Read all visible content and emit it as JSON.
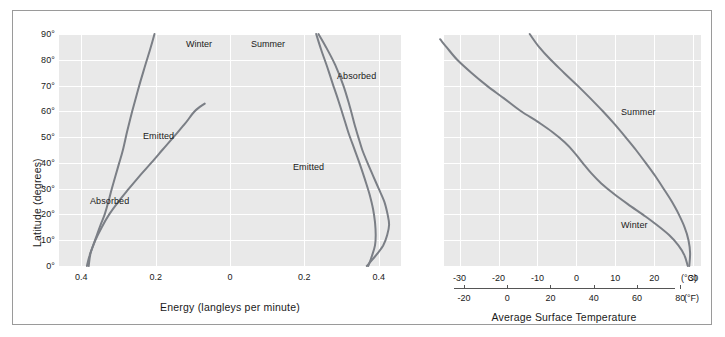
{
  "chart_data": {
    "type": "line",
    "title": "",
    "ylabel": "Latitude (degrees)",
    "ylim": [
      0,
      90
    ],
    "y_ticks": [
      "0°",
      "10°",
      "20°",
      "30°",
      "40°",
      "50°",
      "60°",
      "70°",
      "80°",
      "90°"
    ],
    "y_tick_values": [
      0,
      10,
      20,
      30,
      40,
      50,
      60,
      70,
      80,
      90
    ],
    "grid": true,
    "legend_position": "inline-annotations",
    "panels": [
      {
        "name": "energy-panel",
        "xlabel": "Energy (langleys per minute)",
        "season_headers": [
          "Winter",
          "Summer"
        ],
        "subpanels": [
          {
            "season": "Winter",
            "x_ticks": [
              "0.2",
              "0.4"
            ],
            "x_tick_values": [
              0.2,
              0.4
            ],
            "xlim": [
              0.0,
              0.46
            ],
            "series": [
              {
                "name": "Absorbed",
                "points": [
                  [
                    0.38,
                    0
                  ],
                  [
                    0.375,
                    5
                  ],
                  [
                    0.362,
                    10
                  ],
                  [
                    0.345,
                    15
                  ],
                  [
                    0.325,
                    20
                  ],
                  [
                    0.3,
                    25
                  ],
                  [
                    0.272,
                    30
                  ],
                  [
                    0.243,
                    35
                  ],
                  [
                    0.212,
                    40
                  ],
                  [
                    0.182,
                    45
                  ],
                  [
                    0.152,
                    50
                  ],
                  [
                    0.122,
                    55
                  ],
                  [
                    0.095,
                    60
                  ],
                  [
                    0.068,
                    63
                  ]
                ]
              },
              {
                "name": "Emitted",
                "points": [
                  [
                    0.385,
                    0
                  ],
                  [
                    0.378,
                    4
                  ],
                  [
                    0.368,
                    8
                  ],
                  [
                    0.358,
                    12
                  ],
                  [
                    0.348,
                    16
                  ],
                  [
                    0.337,
                    20
                  ],
                  [
                    0.327,
                    25
                  ],
                  [
                    0.318,
                    30
                  ],
                  [
                    0.308,
                    35
                  ],
                  [
                    0.298,
                    40
                  ],
                  [
                    0.288,
                    45
                  ],
                  [
                    0.277,
                    52
                  ],
                  [
                    0.263,
                    60
                  ],
                  [
                    0.248,
                    68
                  ],
                  [
                    0.232,
                    76
                  ],
                  [
                    0.215,
                    84
                  ],
                  [
                    0.203,
                    90
                  ]
                ]
              }
            ]
          },
          {
            "season": "Summer",
            "x_ticks": [
              "0",
              "0.2",
              "0.4"
            ],
            "x_tick_values": [
              0.0,
              0.2,
              0.4
            ],
            "xlim": [
              0.0,
              0.46
            ],
            "series": [
              {
                "name": "Absorbed",
                "points": [
                  [
                    0.368,
                    0
                  ],
                  [
                    0.392,
                    4
                  ],
                  [
                    0.412,
                    8
                  ],
                  [
                    0.423,
                    12
                  ],
                  [
                    0.428,
                    16
                  ],
                  [
                    0.424,
                    20
                  ],
                  [
                    0.415,
                    25
                  ],
                  [
                    0.4,
                    30
                  ],
                  [
                    0.385,
                    35
                  ],
                  [
                    0.37,
                    40
                  ],
                  [
                    0.356,
                    45
                  ],
                  [
                    0.345,
                    50
                  ],
                  [
                    0.335,
                    55
                  ],
                  [
                    0.322,
                    62
                  ],
                  [
                    0.305,
                    70
                  ],
                  [
                    0.283,
                    78
                  ],
                  [
                    0.258,
                    85
                  ],
                  [
                    0.238,
                    90
                  ]
                ]
              },
              {
                "name": "Emitted",
                "points": [
                  [
                    0.372,
                    0
                  ],
                  [
                    0.382,
                    4
                  ],
                  [
                    0.39,
                    8
                  ],
                  [
                    0.392,
                    12
                  ],
                  [
                    0.39,
                    17
                  ],
                  [
                    0.385,
                    22
                  ],
                  [
                    0.375,
                    28
                  ],
                  [
                    0.362,
                    34
                  ],
                  [
                    0.348,
                    40
                  ],
                  [
                    0.333,
                    46
                  ],
                  [
                    0.318,
                    52
                  ],
                  [
                    0.305,
                    58
                  ],
                  [
                    0.292,
                    64
                  ],
                  [
                    0.278,
                    70
                  ],
                  [
                    0.262,
                    77
                  ],
                  [
                    0.245,
                    84
                  ],
                  [
                    0.232,
                    90
                  ]
                ]
              }
            ]
          }
        ]
      },
      {
        "name": "temperature-panel",
        "xlabel": "Average Surface Temperature",
        "celsius_axis": {
          "unit": "(°C)",
          "ticks": [
            "-30",
            "-20",
            "-10",
            "0",
            "10",
            "20",
            "30"
          ],
          "tick_values": [
            -30,
            -20,
            -10,
            0,
            10,
            20,
            30
          ],
          "xlim": [
            -34,
            32
          ]
        },
        "fahrenheit_axis": {
          "unit": "(°F)",
          "ticks": [
            "-20",
            "0",
            "20",
            "40",
            "60",
            "80"
          ],
          "tick_values": [
            -20,
            0,
            20,
            40,
            60,
            80
          ]
        },
        "series": [
          {
            "name": "Summer",
            "points": [
              [
                29.0,
                0
              ],
              [
                29.2,
                5
              ],
              [
                28.8,
                10
              ],
              [
                27.8,
                15
              ],
              [
                26.3,
                20
              ],
              [
                24.5,
                25
              ],
              [
                22.4,
                30
              ],
              [
                20.2,
                35
              ],
              [
                17.8,
                40
              ],
              [
                15.3,
                45
              ],
              [
                12.6,
                50
              ],
              [
                9.8,
                55
              ],
              [
                6.8,
                60
              ],
              [
                3.6,
                65
              ],
              [
                0.3,
                70
              ],
              [
                -3.2,
                75
              ],
              [
                -6.6,
                80
              ],
              [
                -9.6,
                85
              ],
              [
                -12.0,
                90
              ]
            ]
          },
          {
            "name": "Winter",
            "points": [
              [
                28.6,
                0
              ],
              [
                27.8,
                4
              ],
              [
                26.2,
                8
              ],
              [
                23.8,
                12
              ],
              [
                20.6,
                16
              ],
              [
                17.0,
                20
              ],
              [
                13.2,
                24
              ],
              [
                9.6,
                28
              ],
              [
                6.4,
                32
              ],
              [
                3.8,
                36
              ],
              [
                1.6,
                40
              ],
              [
                -0.5,
                44
              ],
              [
                -3.0,
                48
              ],
              [
                -6.2,
                52
              ],
              [
                -10.0,
                56
              ],
              [
                -14.2,
                60
              ],
              [
                -18.6,
                65
              ],
              [
                -23.0,
                70
              ],
              [
                -27.0,
                75
              ],
              [
                -30.6,
                80
              ],
              [
                -33.4,
                85
              ],
              [
                -35.0,
                88
              ]
            ]
          }
        ]
      }
    ]
  },
  "axes": {
    "y_title": "Latitude (degrees)",
    "energy_x_title": "Energy (langleys per minute)",
    "temperature_x_title": "Average Surface Temperature",
    "celsius_unit": "(°C)",
    "fahrenheit_unit": "(°F)"
  },
  "labels": {
    "winter_header": "Winter",
    "summer_header": "Summer",
    "winter_absorbed": "Absorbed",
    "winter_emitted": "Emitted",
    "summer_absorbed": "Absorbed",
    "summer_emitted": "Emitted",
    "temp_summer": "Summer",
    "temp_winter": "Winter"
  },
  "y_ticks": [
    "90°",
    "80°",
    "70°",
    "60°",
    "50°",
    "40°",
    "30°",
    "20°",
    "10°",
    "0°"
  ],
  "energy_x_ticks": [
    "0.2",
    "0.4",
    "0",
    "0.2",
    "0.4"
  ],
  "celsius_ticks": [
    "-30",
    "-20",
    "-10",
    "0",
    "10",
    "20",
    "30"
  ],
  "fahrenheit_ticks": [
    "-20",
    "0",
    "20",
    "40",
    "60",
    "80"
  ],
  "colors": {
    "plot_background": "#e9e9e9",
    "gridline": "#ffffff",
    "curve": "#7b7f86",
    "frame": "#9a9a9a",
    "text": "#1a1a1a"
  }
}
